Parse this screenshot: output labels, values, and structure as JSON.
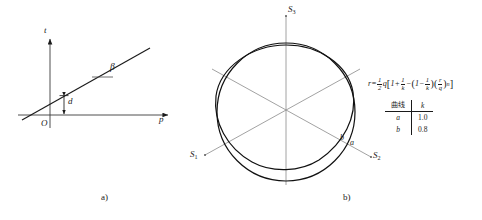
{
  "figure": {
    "panels": [
      {
        "id": "a",
        "caption": "a)",
        "type": "line-plot-schematic",
        "axes": {
          "x_label": "p",
          "y_label": "t",
          "origin_label": "O"
        },
        "annotations": [
          {
            "name": "angle",
            "label": "β"
          },
          {
            "name": "intercept",
            "label": "d"
          }
        ]
      },
      {
        "id": "b",
        "caption": "b)",
        "type": "polar-curves",
        "axes": [
          {
            "name": "S1",
            "base": "S",
            "sub": "1"
          },
          {
            "name": "S2",
            "base": "S",
            "sub": "2"
          },
          {
            "name": "S3",
            "base": "S",
            "sub": "3"
          }
        ],
        "curve_labels": [
          {
            "name": "curve-a",
            "label": "a"
          },
          {
            "name": "curve-b",
            "label": "b"
          }
        ],
        "formula": {
          "lhs": "r",
          "eq": "=",
          "half_num": "1",
          "half_den": "2",
          "q": "q",
          "open_bracket": "[",
          "one": "1",
          "plus": "+",
          "invk_num": "1",
          "invk_den": "k",
          "minus1": "−",
          "open_paren": "(",
          "one2": "1",
          "minus2": "−",
          "invk2_num": "1",
          "invk2_den": "k",
          "close_paren": ")",
          "open_paren2": "(",
          "rq_num": "r",
          "rq_den": "q",
          "close_paren2": ")",
          "exponent": "n",
          "close_bracket": "]",
          "plain": "r = (1/2)q[1 + 1/k − (1 − 1/k)(r/q)ⁿ]"
        },
        "table": {
          "headers": [
            "曲线",
            "k"
          ],
          "rows": [
            {
              "curve": "a",
              "k": "1.0"
            },
            {
              "curve": "b",
              "k": "0.8"
            }
          ]
        }
      }
    ]
  },
  "colors": {
    "ink": "#1a1a1a",
    "axis": "#6e6e6e",
    "curve": "#111111",
    "rule": "#1a1a1a"
  }
}
